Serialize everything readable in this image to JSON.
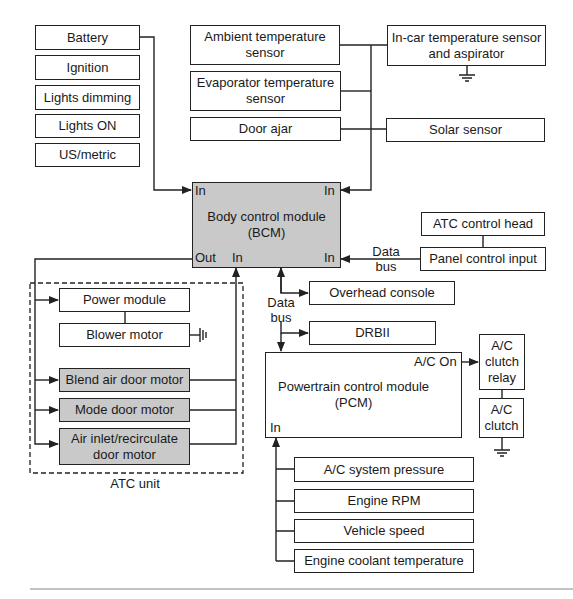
{
  "diagram": {
    "inputs_left": [
      {
        "id": "battery",
        "label": "Battery"
      },
      {
        "id": "ignition",
        "label": "Ignition"
      },
      {
        "id": "lights-dimming",
        "label": "Lights dimming"
      },
      {
        "id": "lights-on",
        "label": "Lights ON"
      },
      {
        "id": "us-metric",
        "label": "US/metric"
      }
    ],
    "sensors_top": [
      {
        "id": "ambient-temp",
        "label": "Ambient temperature\nsensor"
      },
      {
        "id": "evaporator-temp",
        "label": "Evaporator temperature\nsensor"
      },
      {
        "id": "door-ajar",
        "label": "Door ajar"
      }
    ],
    "sensors_right": [
      {
        "id": "in-car-temp",
        "label": "In-car temperature sensor\nand aspirator"
      },
      {
        "id": "solar-sensor",
        "label": "Solar sensor"
      }
    ],
    "bcm": {
      "label": "Body control module\n(BCM)",
      "ports": {
        "in_top_left": "In",
        "in_top_right": "In",
        "out_bottom_left": "Out",
        "in_bottom_mid": "In",
        "in_bottom_right": "In"
      },
      "fill": "#c9c9c9"
    },
    "atc_control_head": "ATC control head",
    "panel_control_input": "Panel control input",
    "data_bus_label": "Data\nbus",
    "overhead_console": "Overhead console",
    "drbii": "DRBII",
    "pcm": {
      "label": "Powertrain control module\n(PCM)",
      "ports": {
        "ac_on": "A/C On",
        "in": "In"
      }
    },
    "ac_clutch_relay": "A/C\nclutch\nrelay",
    "ac_clutch": "A/C\nclutch",
    "pcm_inputs": [
      {
        "id": "ac-system-pressure",
        "label": "A/C system pressure"
      },
      {
        "id": "engine-rpm",
        "label": "Engine RPM"
      },
      {
        "id": "vehicle-speed",
        "label": "Vehicle speed"
      },
      {
        "id": "engine-coolant-temp",
        "label": "Engine coolant temperature"
      }
    ],
    "atc_unit": {
      "label": "ATC unit",
      "components": [
        {
          "id": "power-module",
          "label": "Power module",
          "shaded": false
        },
        {
          "id": "blower-motor",
          "label": "Blower motor",
          "shaded": false
        },
        {
          "id": "blend-air-door-motor",
          "label": "Blend air door motor",
          "shaded": true
        },
        {
          "id": "mode-door-motor",
          "label": "Mode door motor",
          "shaded": true
        },
        {
          "id": "air-inlet-recirculate",
          "label": "Air inlet/recirculate\ndoor motor",
          "shaded": true
        }
      ]
    },
    "colors": {
      "line": "#222222",
      "shade": "#c9c9c9",
      "background": "#ffffff"
    }
  }
}
